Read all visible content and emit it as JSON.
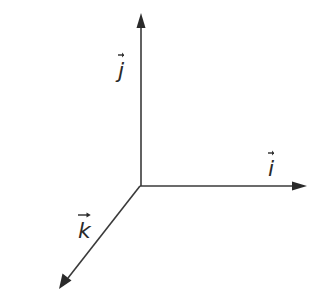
{
  "diagram": {
    "type": "3d-coordinate-axes",
    "stroke_color": "#3a3a3a",
    "origin": {
      "x": 140,
      "y": 186
    },
    "axes": [
      {
        "id": "i",
        "direction": "right",
        "label": "i",
        "vector_notation": true,
        "tip": {
          "x": 307,
          "y": 186
        }
      },
      {
        "id": "j",
        "direction": "up",
        "label": "j",
        "vector_notation": true,
        "tip": {
          "x": 141,
          "y": 13
        }
      },
      {
        "id": "k",
        "direction": "down-left",
        "label": "k",
        "vector_notation": true,
        "tip": {
          "x": 59,
          "y": 289
        }
      }
    ]
  }
}
